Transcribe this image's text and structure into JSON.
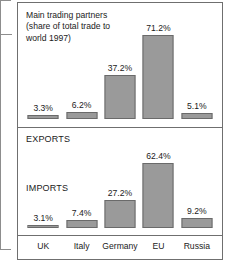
{
  "chart_data": {
    "type": "bar",
    "title": "Main trading partners\n(share of total trade to\nworld 1997)",
    "xlabel": "",
    "ylabel": "",
    "ylim": [
      0,
      75
    ],
    "grid": false,
    "legend_position": "inside-panel",
    "categories": [
      "UK",
      "Italy",
      "Germany",
      "EU",
      "Russia"
    ],
    "series": [
      {
        "name": "EXPORTS",
        "values": [
          3.3,
          6.2,
          37.2,
          71.2,
          5.1
        ],
        "labels": [
          "3.3%",
          "6.2%",
          "37.2%",
          "71.2%",
          "5.1%"
        ]
      },
      {
        "name": "IMPORTS",
        "values": [
          3.1,
          7.4,
          27.2,
          62.4,
          9.2
        ],
        "labels": [
          "3.1%",
          "7.4%",
          "27.2%",
          "62.4%",
          "9.2%"
        ]
      }
    ],
    "bar_color": "#9a9a9a",
    "bar_outline_color": "#6a6a6a",
    "frame_color": "#6f6f6f",
    "text_color": "#1b1b1b"
  }
}
